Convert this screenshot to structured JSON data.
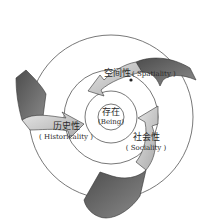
{
  "diagram": {
    "center": {
      "zh": "存在",
      "en": "(Being)"
    },
    "nodes": [
      {
        "id": "spatiality",
        "zh": "空间性",
        "en": "( Spatiality )"
      },
      {
        "id": "historicality",
        "zh": "历史性",
        "en": "( Historicality )"
      },
      {
        "id": "sociality",
        "zh": "社会性",
        "en": "( Sociality )"
      }
    ],
    "colors": {
      "circle_stroke": "#555555",
      "arrow_dark": "#6e6e6e",
      "arrow_light": "#c8c8c8",
      "arrow_stroke": "#333333"
    }
  }
}
